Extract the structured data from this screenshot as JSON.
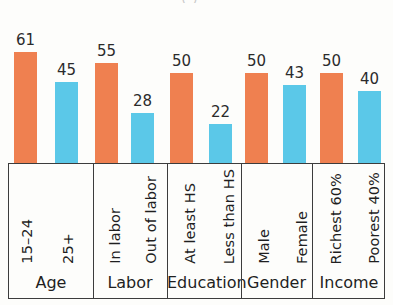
{
  "figure": {
    "title_remnant": "( )",
    "background_color": "#fdfdfb",
    "colors": {
      "orange": "#ef8050",
      "blue": "#5bc8e8",
      "box_border": "#3c3c3c",
      "text": "#1f1f1f"
    }
  },
  "chart_data": {
    "type": "bar",
    "title": "",
    "subtitle": "",
    "xlabel": "",
    "ylabel": "",
    "ylim": [
      0,
      70
    ],
    "grid": false,
    "legend": null,
    "note": "Grouped bar chart of percentages by demographic category; each bar is directly labeled with its value.",
    "categories": [
      "15–24",
      "25+",
      "In labor",
      "Out of labor",
      "At least HS",
      "Less than HS",
      "Male",
      "Female",
      "Richest 60%",
      "Poorest 40%"
    ],
    "values": [
      61,
      45,
      55,
      28,
      50,
      22,
      50,
      43,
      50,
      40
    ],
    "bar_colors": [
      "#ef8050",
      "#5bc8e8",
      "#ef8050",
      "#5bc8e8",
      "#ef8050",
      "#5bc8e8",
      "#ef8050",
      "#5bc8e8",
      "#ef8050",
      "#5bc8e8"
    ],
    "groups": [
      {
        "label": "Age",
        "categories": [
          "15–24",
          "25+"
        ],
        "values": [
          61,
          45
        ]
      },
      {
        "label": "Labor",
        "categories": [
          "In labor",
          "Out of labor"
        ],
        "values": [
          55,
          28
        ]
      },
      {
        "label": "Education",
        "categories": [
          "At least HS",
          "Less than HS"
        ],
        "values": [
          50,
          22
        ]
      },
      {
        "label": "Gender",
        "categories": [
          "Male",
          "Female"
        ],
        "values": [
          50,
          43
        ]
      },
      {
        "label": "Income",
        "categories": [
          "Richest 60%",
          "Poorest 40%"
        ],
        "values": [
          50,
          40
        ]
      }
    ]
  },
  "bars": [
    {
      "label": "15–24",
      "value": "61",
      "color": "orange",
      "x": 14,
      "w": 23,
      "group": 0
    },
    {
      "label": "25+",
      "value": "45",
      "color": "blue",
      "x": 55,
      "w": 23,
      "group": 0
    },
    {
      "label": "In labor",
      "value": "55",
      "color": "orange",
      "x": 95,
      "w": 23,
      "group": 1
    },
    {
      "label": "Out of labor",
      "value": "28",
      "color": "blue",
      "x": 131,
      "w": 23,
      "group": 1
    },
    {
      "label": "At least HS",
      "value": "50",
      "color": "orange",
      "x": 170,
      "w": 23,
      "group": 2
    },
    {
      "label": "Less than HS",
      "value": "22",
      "color": "blue",
      "x": 209,
      "w": 23,
      "group": 2
    },
    {
      "label": "Male",
      "value": "50",
      "color": "orange",
      "x": 245,
      "w": 23,
      "group": 3
    },
    {
      "label": "Female",
      "value": "43",
      "color": "blue",
      "x": 283,
      "w": 23,
      "group": 3
    },
    {
      "label": "Richest 60%",
      "value": "50",
      "color": "orange",
      "x": 320,
      "w": 23,
      "group": 4
    },
    {
      "label": "Poorest 40%",
      "value": "40",
      "color": "blue",
      "x": 358,
      "w": 23,
      "group": 4
    }
  ],
  "groups": [
    {
      "label": "Age",
      "left": 0,
      "width": 84,
      "cats": [
        {
          "text": "15–24",
          "cx": 18
        },
        {
          "text": "25+",
          "cx": 59
        }
      ]
    },
    {
      "label": "Labor",
      "left": 84,
      "width": 74,
      "cats": [
        {
          "text": "In labor",
          "cx": 22
        },
        {
          "text": "Out of labor",
          "cx": 58
        }
      ]
    },
    {
      "label": "Education",
      "left": 158,
      "width": 74,
      "cats": [
        {
          "text": "At least HS",
          "cx": 23
        },
        {
          "text": "Less than HS",
          "cx": 62
        }
      ]
    },
    {
      "label": "Gender",
      "left": 232,
      "width": 71,
      "cats": [
        {
          "text": "Male",
          "cx": 23
        },
        {
          "text": "Female",
          "cx": 61
        }
      ]
    },
    {
      "label": "Income",
      "left": 303,
      "width": 74,
      "cats": [
        {
          "text": "Richest 60%",
          "cx": 24
        },
        {
          "text": "Poorest 40%",
          "cx": 62
        }
      ]
    }
  ]
}
